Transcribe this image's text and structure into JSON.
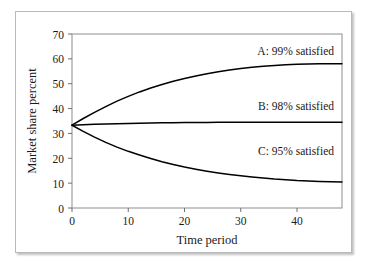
{
  "figure": {
    "caption_fragment": "",
    "background_color": "#ffffff",
    "frame_color": "#b9b9b9",
    "curve_color": "#000000"
  },
  "chart_data": {
    "type": "line",
    "title": "",
    "xlabel": "Time period",
    "ylabel": "Market share percent",
    "xlim": [
      0,
      48
    ],
    "ylim": [
      0,
      70
    ],
    "xticks": [
      0,
      10,
      20,
      30,
      40
    ],
    "yticks": [
      0,
      10,
      20,
      30,
      40,
      50,
      60,
      70
    ],
    "grid": false,
    "legend": "inline-annotations",
    "x": [
      0,
      2,
      4,
      6,
      8,
      10,
      12,
      14,
      16,
      18,
      20,
      22,
      24,
      26,
      28,
      30,
      32,
      34,
      36,
      38,
      40,
      42,
      44,
      46,
      48
    ],
    "series": [
      {
        "name": "A: 99% satisfied",
        "label": "A: 99% satisfied",
        "values": [
          33.3,
          36.0,
          38.5,
          40.8,
          43.0,
          44.9,
          46.7,
          48.3,
          49.7,
          51.0,
          52.1,
          53.1,
          54.0,
          54.8,
          55.5,
          56.1,
          56.6,
          57.0,
          57.3,
          57.6,
          57.8,
          57.9,
          58.0,
          58.0,
          58.0
        ]
      },
      {
        "name": "B: 98% satisfied",
        "label": "B: 98% satisfied",
        "values": [
          33.3,
          33.5,
          33.7,
          33.8,
          33.9,
          34.0,
          34.1,
          34.2,
          34.25,
          34.3,
          34.35,
          34.4,
          34.42,
          34.45,
          34.47,
          34.5,
          34.5,
          34.5,
          34.5,
          34.5,
          34.5,
          34.5,
          34.5,
          34.5,
          34.5
        ]
      },
      {
        "name": "C: 95% satisfied",
        "label": "C: 95% satisfied",
        "values": [
          33.3,
          30.8,
          28.5,
          26.4,
          24.5,
          22.8,
          21.3,
          19.9,
          18.6,
          17.5,
          16.5,
          15.6,
          14.8,
          14.1,
          13.5,
          13.0,
          12.5,
          12.1,
          11.7,
          11.4,
          11.1,
          10.9,
          10.7,
          10.6,
          10.5
        ]
      }
    ],
    "annotations": [
      {
        "text": "A: 99% satisfied",
        "x": 33,
        "y": 63
      },
      {
        "text": "B: 98% satisfied",
        "x": 33,
        "y": 41
      },
      {
        "text": "C: 95% satisfied",
        "x": 33,
        "y": 23
      }
    ]
  }
}
